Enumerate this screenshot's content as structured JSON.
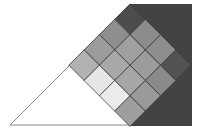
{
  "diagram": {
    "background": "#ffffff",
    "dark_rect": {
      "x": 130,
      "y": 4,
      "width": 62,
      "height": 122,
      "fill": "#434343"
    },
    "triangle": {
      "points": [
        [
          10,
          125
        ],
        [
          130,
          125
        ],
        [
          130,
          5
        ]
      ],
      "fill": "#ffffff",
      "stroke": "#8a8a8a"
    },
    "grid": {
      "top_vertex": [
        130,
        4
      ],
      "step": 15.3,
      "rows": 4,
      "cols": 4,
      "stroke": "#3a3a3a",
      "cell_fills": [
        [
          "#4c4c4c",
          "#8c8c8c",
          "#8e8e8e",
          "#525252"
        ],
        [
          "#8e8e8e",
          "#a0a0a0",
          "#9c9c9c",
          "#8a8a8a"
        ],
        [
          "#9c9c9c",
          "#a8a8a8",
          "#a6a6a6",
          "#9a9a9a"
        ],
        [
          "#b2b2b2",
          "#e6e6e6",
          "#ebebeb",
          "#9e9e9e"
        ]
      ]
    }
  }
}
